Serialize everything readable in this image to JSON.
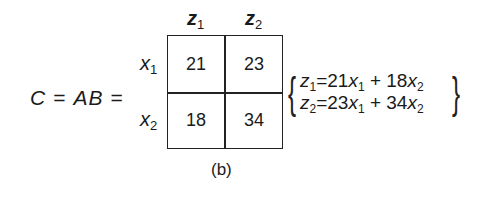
{
  "equation": {
    "lhs_var": "C",
    "equals": "=",
    "product": "AB"
  },
  "matrix": {
    "col_headers": [
      {
        "var": "z",
        "sub": "1"
      },
      {
        "var": "z",
        "sub": "2"
      }
    ],
    "row_headers": [
      {
        "var": "x",
        "sub": "1"
      },
      {
        "var": "x",
        "sub": "2"
      }
    ],
    "cells": [
      [
        "21",
        "23"
      ],
      [
        "18",
        "34"
      ]
    ]
  },
  "system": [
    {
      "lhs": "z",
      "lhs_sub": "1",
      "eq": "=",
      "c1": "21",
      "v1": "x",
      "s1": "1",
      "plus": "+",
      "c2": "18",
      "v2": "x",
      "s2": "2"
    },
    {
      "lhs": "z",
      "lhs_sub": "2",
      "eq": "=",
      "c1": "23",
      "v1": "x",
      "s1": "1",
      "plus": "+",
      "c2": "34",
      "v2": "x",
      "s2": "2"
    }
  ],
  "caption": "(b)"
}
